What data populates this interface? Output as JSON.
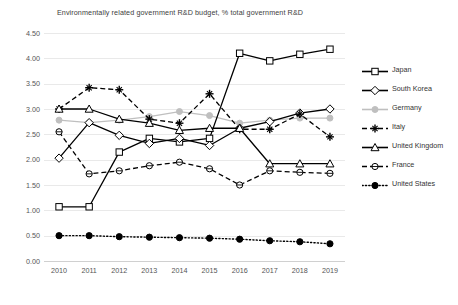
{
  "chart_data": {
    "type": "line",
    "title": "Environmentally related government R&D budget, % total government R&D",
    "xlabel": "",
    "ylabel": "",
    "ylim": [
      0.0,
      4.5
    ],
    "ytick_labels": [
      "0.00",
      "0.50",
      "1.00",
      "1.50",
      "2.00",
      "2.50",
      "3.00",
      "3.50",
      "4.00",
      "4.50"
    ],
    "ytick_values": [
      0.0,
      0.5,
      1.0,
      1.5,
      2.0,
      2.5,
      3.0,
      3.5,
      4.0,
      4.5
    ],
    "grid": true,
    "legend_position": "right",
    "categories": [
      "2010",
      "2011",
      "2012",
      "2013",
      "2014",
      "2015",
      "2016",
      "2017",
      "2018",
      "2019"
    ],
    "x": [
      2010,
      2011,
      2012,
      2013,
      2014,
      2015,
      2016,
      2017,
      2018,
      2019
    ],
    "series": [
      {
        "name": "Japan",
        "marker": "square-open",
        "line": "solid",
        "color": "#000000",
        "values": [
          1.07,
          1.07,
          2.15,
          2.42,
          2.35,
          2.42,
          4.1,
          3.95,
          4.08,
          4.18
        ]
      },
      {
        "name": "South Korea",
        "marker": "diamond-open",
        "line": "solid",
        "color": "#000000",
        "values": [
          2.03,
          2.73,
          2.48,
          2.32,
          2.42,
          2.28,
          2.62,
          2.75,
          2.92,
          3.0
        ]
      },
      {
        "name": "Germany",
        "marker": "circle-filled",
        "line": "solid",
        "color": "#bfbfbf",
        "values": [
          2.78,
          2.73,
          2.78,
          2.85,
          2.95,
          2.87,
          2.72,
          2.78,
          2.82,
          2.82
        ]
      },
      {
        "name": "Italy",
        "marker": "plus",
        "line": "dashed",
        "color": "#000000",
        "values": [
          3.0,
          3.42,
          3.38,
          2.8,
          2.72,
          3.3,
          2.6,
          2.6,
          2.9,
          2.45
        ]
      },
      {
        "name": "United Kingdom",
        "marker": "triangle-open",
        "line": "solid",
        "color": "#000000",
        "values": [
          3.0,
          3.0,
          2.8,
          2.72,
          2.58,
          2.62,
          2.62,
          1.92,
          1.92,
          1.92
        ]
      },
      {
        "name": "France",
        "marker": "circle-open",
        "line": "dashed",
        "color": "#000000",
        "values": [
          2.55,
          1.72,
          1.78,
          1.88,
          1.95,
          1.82,
          1.5,
          1.78,
          1.75,
          1.73
        ]
      },
      {
        "name": "United States",
        "marker": "circle-solid",
        "line": "dotted",
        "color": "#000000",
        "values": [
          0.5,
          0.5,
          0.48,
          0.47,
          0.46,
          0.45,
          0.43,
          0.4,
          0.38,
          0.34
        ]
      }
    ]
  },
  "legend": {
    "items": [
      {
        "label": "Japan"
      },
      {
        "label": "South Korea"
      },
      {
        "label": "Germany"
      },
      {
        "label": "Italy"
      },
      {
        "label": "United Kingdom"
      },
      {
        "label": "France"
      },
      {
        "label": "United States"
      }
    ]
  }
}
